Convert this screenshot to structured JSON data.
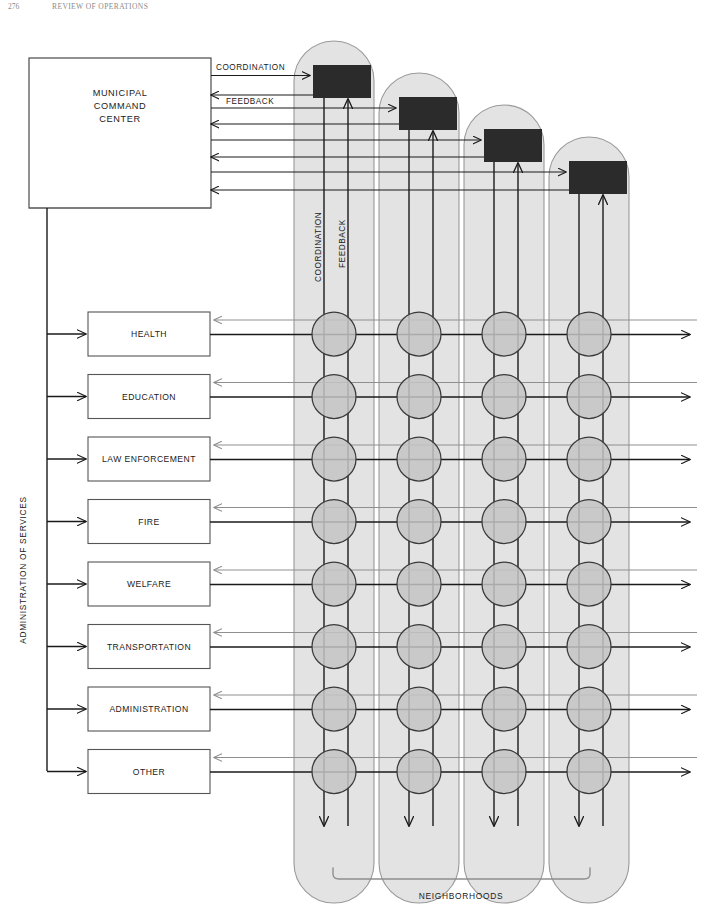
{
  "page": {
    "header_folio": "276",
    "header_title": "REVIEW OF OPERATIONS",
    "background_color": "#ffffff"
  },
  "colors": {
    "column_fill": "#e3e3e3",
    "column_stroke": "#9a9a9a",
    "node_fill": "#c4c4c4",
    "node_stroke": "#3a3a3a",
    "command_box_fill": "#ffffff",
    "command_box_stroke": "#4a4a4a",
    "neighborhood_box_fill": "#2b2b2b",
    "line_dark": "#1a1a1a",
    "line_gray": "#8f8f8f",
    "service_box_stroke": "#555555"
  },
  "command_center": {
    "label_line_1": "MUNICIPAL",
    "label_line_2": "COMMAND",
    "label_line_3": "CENTER"
  },
  "flow_labels": {
    "coordination_horizontal": "COORDINATION",
    "feedback_horizontal": "FEEDBACK",
    "coordination_vertical": "COORDINATION",
    "feedback_vertical": "FEEDBACK"
  },
  "administration": {
    "axis_label": "ADMINISTRATION OF SERVICES",
    "services": [
      {
        "label": "HEALTH"
      },
      {
        "label": "EDUCATION"
      },
      {
        "label": "LAW ENFORCEMENT"
      },
      {
        "label": "FIRE"
      },
      {
        "label": "WELFARE"
      },
      {
        "label": "TRANSPORTATION"
      },
      {
        "label": "ADMINISTRATION"
      },
      {
        "label": "OTHER"
      }
    ]
  },
  "neighborhoods": {
    "bracket_label": "NEIGHBORHOODS",
    "count": 4,
    "columns": [
      {
        "index": 1
      },
      {
        "index": 2
      },
      {
        "index": 3
      },
      {
        "index": 4
      }
    ]
  }
}
